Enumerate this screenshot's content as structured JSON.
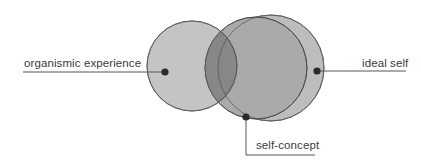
{
  "diagram": {
    "colors": {
      "background": "#ffffff",
      "circle_fill_left": "#c2c2c2",
      "circle_fill_right": "#bdbdbd",
      "circle_fill_middle": "#a9a9a9",
      "overlap_dark": "#858585",
      "circle_stroke": "#5a5a5a",
      "leader_line": "#555555",
      "dot": "#2a2a2a",
      "text": "#3a3a3a"
    },
    "circles": [
      {
        "id": "organismic-experience",
        "cx": 192,
        "cy": 66,
        "r": 45
      },
      {
        "id": "ideal-self",
        "cx": 271,
        "cy": 68,
        "r": 53
      },
      {
        "id": "self-concept",
        "cx": 256,
        "cy": 68,
        "r": 51
      }
    ],
    "labels": {
      "organismic_experience": "organismic experience",
      "ideal_self": "ideal self",
      "self_concept": "self-concept"
    }
  }
}
